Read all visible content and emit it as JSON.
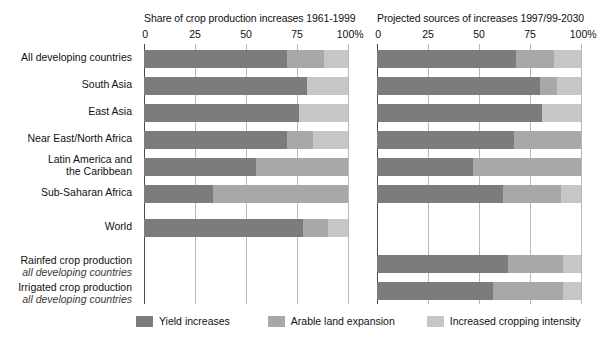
{
  "chart_data": {
    "type": "bar",
    "orientation": "horizontal",
    "stacked": true,
    "stack_mode": "percent",
    "grid": true,
    "legend_position": "bottom",
    "xlim": [
      0,
      100
    ],
    "xticks": [
      0,
      25,
      50,
      75,
      100
    ],
    "xtick_labels": [
      "0",
      "25",
      "50",
      "75",
      "100%"
    ],
    "xlabel": "",
    "ylabel": "",
    "series_names": [
      "Yield increases",
      "Arable land expansion",
      "Increased cropping intensity"
    ],
    "series_colors": [
      "#7c7c7c",
      "#a8a8a8",
      "#c6c6c6"
    ],
    "categories": [
      "All developing countries",
      "South Asia",
      "East Asia",
      "Near East/North Africa",
      "Latin America and the Caribbean",
      "Sub-Saharan Africa",
      "World",
      "Rainfed crop production all developing countries",
      "Irrigated crop production all developing countries"
    ],
    "panels": [
      {
        "title": "Share of crop production increases 1961-1999",
        "rows": [
          {
            "category": "All developing countries",
            "values": [
              70,
              18,
              12
            ]
          },
          {
            "category": "South Asia",
            "values": [
              80,
              0,
              20
            ]
          },
          {
            "category": "East Asia",
            "values": [
              76,
              0,
              24
            ]
          },
          {
            "category": "Near East/North Africa",
            "values": [
              70,
              13,
              17
            ]
          },
          {
            "category": "Latin America and the Caribbean",
            "values": [
              55,
              45,
              0
            ]
          },
          {
            "category": "Sub-Saharan Africa",
            "values": [
              34,
              66,
              0
            ]
          },
          {
            "category": "World",
            "values": [
              78,
              12,
              10
            ]
          },
          {
            "category": "Rainfed crop production all developing countries",
            "values": [
              null,
              null,
              null
            ]
          },
          {
            "category": "Irrigated crop production all developing countries",
            "values": [
              null,
              null,
              null
            ]
          }
        ]
      },
      {
        "title": "Projected sources of increases 1997/99-2030",
        "rows": [
          {
            "category": "All developing countries",
            "values": [
              68,
              19,
              13
            ]
          },
          {
            "category": "South Asia",
            "values": [
              80,
              8,
              12
            ]
          },
          {
            "category": "East Asia",
            "values": [
              81,
              0,
              19
            ]
          },
          {
            "category": "Near East/North Africa",
            "values": [
              67,
              33,
              0
            ]
          },
          {
            "category": "Latin America and the Caribbean",
            "values": [
              47,
              53,
              0
            ]
          },
          {
            "category": "Sub-Saharan Africa",
            "values": [
              62,
              28,
              10
            ]
          },
          {
            "category": "World",
            "values": [
              null,
              null,
              null
            ]
          },
          {
            "category": "Rainfed crop production all developing countries",
            "values": [
              64,
              27,
              9
            ]
          },
          {
            "category": "Irrigated crop production all developing countries",
            "values": [
              57,
              34,
              9
            ]
          }
        ]
      }
    ]
  },
  "panels": {
    "left": {
      "title": "Share of crop production increases 1961-1999"
    },
    "right": {
      "title": "Projected sources of increases 1997/99-2030"
    }
  },
  "axis": {
    "ticks": [
      {
        "label": "0",
        "value": 0
      },
      {
        "label": "25",
        "value": 25
      },
      {
        "label": "50",
        "value": 50
      },
      {
        "label": "75",
        "value": 75
      },
      {
        "label": "100%",
        "value": 100
      }
    ]
  },
  "rows": [
    {
      "main": "All developing countries",
      "sub": ""
    },
    {
      "main": "South Asia",
      "sub": ""
    },
    {
      "main": "East Asia",
      "sub": ""
    },
    {
      "main": "Near East/North Africa",
      "sub": ""
    },
    {
      "main": "Latin America and",
      "sub2": "the Caribbean"
    },
    {
      "main": "Sub-Saharan Africa",
      "sub": ""
    },
    {
      "main": "World",
      "sub": ""
    },
    {
      "main": "Rainfed crop production",
      "sub": "all developing countries"
    },
    {
      "main": "Irrigated crop production",
      "sub": "all developing countries"
    }
  ],
  "legend": {
    "items": [
      {
        "label": "Yield increases",
        "color": "#7c7c7c"
      },
      {
        "label": "Arable land expansion",
        "color": "#a8a8a8"
      },
      {
        "label": "Increased cropping intensity",
        "color": "#c6c6c6"
      }
    ]
  }
}
